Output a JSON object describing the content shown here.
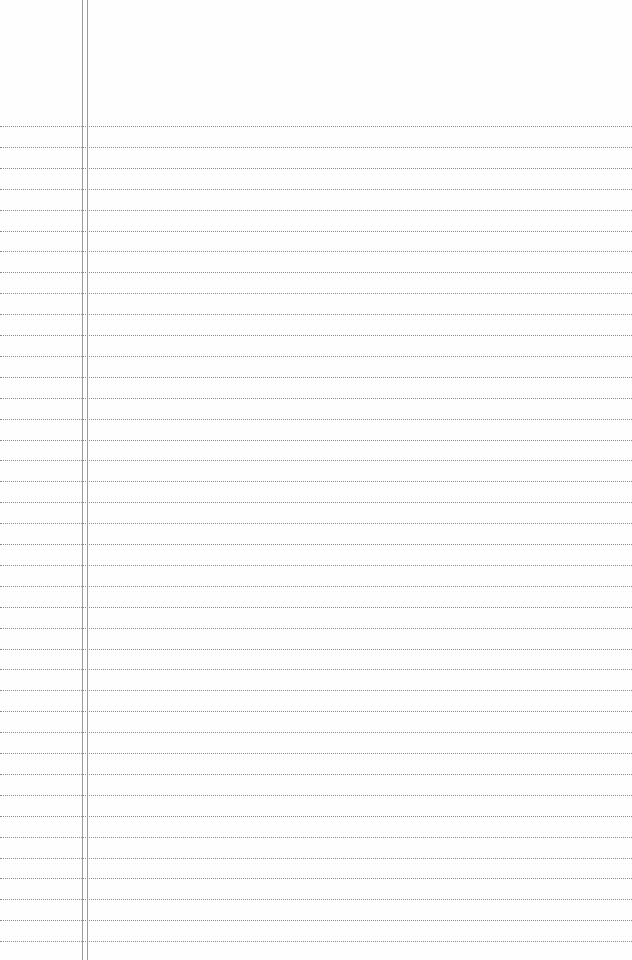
{
  "page": {
    "type": "lined-paper",
    "background_color": "#fefefe",
    "rule_color": "#8c8c8c",
    "margin_line_color": "#9a9a9a",
    "first_rule_y": 126,
    "rule_spacing": 20.9,
    "rule_count": 40,
    "margin_lines_x": [
      82,
      87
    ]
  }
}
